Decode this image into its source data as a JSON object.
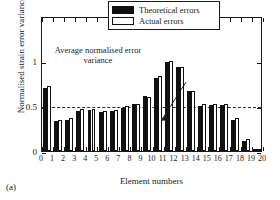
{
  "chart_data": {
    "type": "bar",
    "title": "",
    "xlabel": "Element numbers",
    "ylabel": "Normalised strain error variance",
    "categories": [
      "1",
      "2",
      "3",
      "4",
      "5",
      "6",
      "7",
      "8",
      "9",
      "10",
      "11",
      "12",
      "13",
      "14",
      "15",
      "16",
      "17",
      "18",
      "19",
      "20"
    ],
    "xticks": [
      "0",
      "1",
      "2",
      "3",
      "4",
      "5",
      "6",
      "7",
      "8",
      "9",
      "10",
      "11",
      "12",
      "13",
      "14",
      "15",
      "16",
      "17",
      "18",
      "19",
      "20"
    ],
    "yticks": [
      "0",
      "0.5",
      "1"
    ],
    "ylim": [
      0,
      1.5
    ],
    "xlim": [
      0,
      20
    ],
    "grid": false,
    "legend_position": "top-right",
    "series": [
      {
        "name": "Theoretical errors",
        "color": "#111111",
        "fill": "solid",
        "values": [
          0.7,
          0.33,
          0.35,
          0.45,
          0.46,
          0.43,
          0.44,
          0.48,
          0.52,
          0.61,
          0.81,
          0.99,
          0.93,
          0.67,
          0.5,
          0.51,
          0.51,
          0.35,
          0.11,
          0.015
        ]
      },
      {
        "name": "Actual errors",
        "color": "#ffffff",
        "fill": "hollow",
        "values": [
          0.72,
          0.34,
          0.37,
          0.47,
          0.47,
          0.45,
          0.46,
          0.5,
          0.52,
          0.6,
          0.83,
          1.0,
          0.93,
          0.67,
          0.52,
          0.52,
          0.52,
          0.37,
          0.13,
          0.025
        ]
      }
    ],
    "reference_line": {
      "label": "Average normalised error variance",
      "value": 0.51,
      "style": "dashed"
    }
  },
  "legend": {
    "items": [
      {
        "label": "Theoretical errors"
      },
      {
        "label": "Actual errors"
      }
    ]
  },
  "annotation": {
    "text": "Average normalised error variance"
  },
  "caption": {
    "text": "(a)"
  }
}
